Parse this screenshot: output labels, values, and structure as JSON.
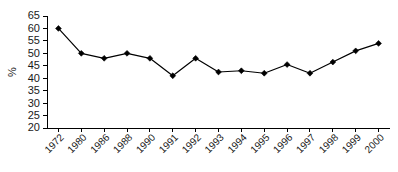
{
  "chart_data": {
    "type": "line",
    "title": "",
    "xlabel": "",
    "ylabel": "%",
    "categories": [
      "1972",
      "1980",
      "1986",
      "1988",
      "1990",
      "1991",
      "1992",
      "1993",
      "1994",
      "1995",
      "1996",
      "1997",
      "1998",
      "1999",
      "2000"
    ],
    "values": [
      60,
      50,
      48,
      50,
      48,
      41,
      48,
      42.5,
      43,
      42,
      45.5,
      42,
      46.5,
      51,
      54
    ],
    "ylim": [
      20,
      65
    ],
    "ytick_step": 5,
    "yticks": [
      "65",
      "60",
      "55",
      "50",
      "45",
      "40",
      "35",
      "30",
      "25",
      "20"
    ],
    "grid": false,
    "legend": false,
    "marker": "diamond",
    "line_color": "#000000",
    "marker_color": "#000000",
    "background_color": "#ffffff",
    "xtick_label_rotation": -45
  }
}
